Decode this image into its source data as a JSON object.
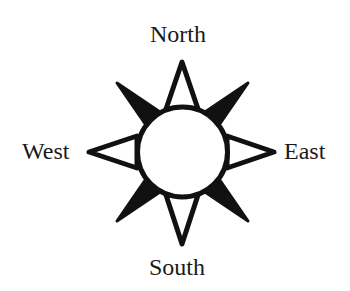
{
  "diagram": {
    "type": "compass-rose",
    "labels": {
      "north": "North",
      "south": "South",
      "east": "East",
      "west": "West"
    },
    "colors": {
      "ink": "#111111",
      "background": "#ffffff"
    }
  }
}
